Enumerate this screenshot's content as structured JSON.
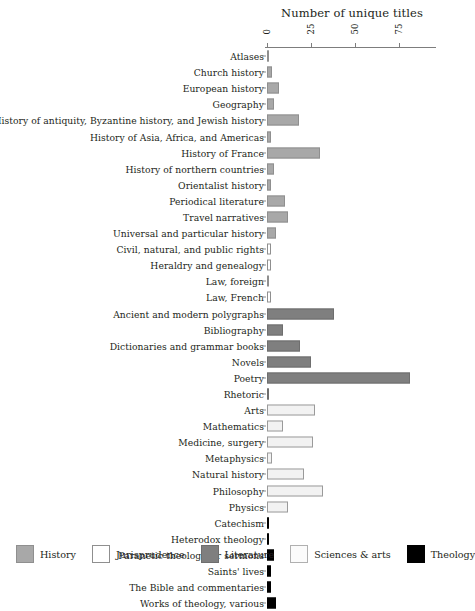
{
  "chart_data": {
    "type": "bar",
    "orientation": "horizontal",
    "title": "",
    "xlabel": "Number of unique titles",
    "ylabel": "",
    "xlim": [
      0,
      85
    ],
    "xticks": [
      0,
      25,
      50,
      75
    ],
    "xticklabels": [
      "0",
      "25",
      "50",
      "75"
    ],
    "grid": false,
    "legend_position": "bottom",
    "categories": [
      "Atlases",
      "Church history",
      "European history",
      "Geography",
      "History of antiquity, Byzantine history, and Jewish history",
      "History of Asia, Africa, and Americas",
      "History of France",
      "History of northern countries",
      "Orientalist history",
      "Periodical literature",
      "Travel narratives",
      "Universal and particular history",
      "Civil, natural, and public rights",
      "Heraldry and genealogy",
      "Law, foreign",
      "Law, French",
      "Ancient and modern polygraphs",
      "Bibliography",
      "Dictionaries and grammar books",
      "Novels",
      "Poetry",
      "Rhetoric",
      "Arts",
      "Mathematics",
      "Medicine, surgery",
      "Metaphysics",
      "Natural history",
      "Philosophy",
      "Physics",
      "Catechism",
      "Heterodox theology",
      "Paranetic theology, or sermons",
      "Saints' lives",
      "The Bible and commentaries",
      "Works of theology, various"
    ],
    "values": [
      1,
      3,
      7,
      4,
      18,
      2,
      30,
      4,
      2,
      10,
      12,
      5,
      2,
      2,
      1,
      2,
      38,
      9,
      19,
      25,
      81,
      1,
      27,
      9,
      26,
      3,
      21,
      32,
      12,
      1,
      1,
      4,
      2,
      2,
      5
    ],
    "group_of_category": [
      "History",
      "History",
      "History",
      "History",
      "History",
      "History",
      "History",
      "History",
      "History",
      "History",
      "History",
      "History",
      "Jurisprudence",
      "Jurisprudence",
      "Jurisprudence",
      "Jurisprudence",
      "Literature",
      "Literature",
      "Literature",
      "Literature",
      "Literature",
      "Literature",
      "Sciences & arts",
      "Sciences & arts",
      "Sciences & arts",
      "Sciences & arts",
      "Sciences & arts",
      "Sciences & arts",
      "Sciences & arts",
      "Theology",
      "Theology",
      "Theology",
      "Theology",
      "Theology",
      "Theology"
    ],
    "series": [
      {
        "name": "History",
        "color": "#a8a8a8",
        "edge": "#8f8f8f"
      },
      {
        "name": "Jurisprudence",
        "color": "#ffffff",
        "edge": "#8f8f8f"
      },
      {
        "name": "Literature",
        "color": "#7f7f7f",
        "edge": "#6e6e6e"
      },
      {
        "name": "Sciences & arts",
        "color": "#f2f2f2",
        "edge": "#9a9a9a"
      },
      {
        "name": "Theology",
        "color": "#000000",
        "edge": "#000000"
      }
    ]
  },
  "axis": {
    "title": "Number of unique titles"
  },
  "legend": {
    "items": [
      {
        "label": "History",
        "color": "#a8a8a8",
        "edge": "#8f8f8f"
      },
      {
        "label": "Jurisprudence",
        "color": "#ffffff",
        "edge": "#8f8f8f"
      },
      {
        "label": "Literature",
        "color": "#7f7f7f",
        "edge": "#6e6e6e"
      },
      {
        "label": "Sciences & arts",
        "color": "#fbfbfb",
        "edge": "#b0b0b0"
      },
      {
        "label": "Theology",
        "color": "#000000",
        "edge": "#000000"
      }
    ]
  }
}
